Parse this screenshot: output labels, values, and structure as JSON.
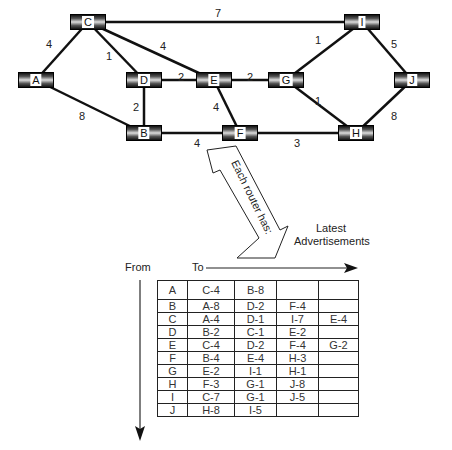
{
  "nodes": [
    {
      "id": "C",
      "x": 88,
      "y": 22
    },
    {
      "id": "I",
      "x": 362,
      "y": 22
    },
    {
      "id": "A",
      "x": 36,
      "y": 80
    },
    {
      "id": "D",
      "x": 144,
      "y": 80
    },
    {
      "id": "E",
      "x": 214,
      "y": 80
    },
    {
      "id": "G",
      "x": 286,
      "y": 80
    },
    {
      "id": "J",
      "x": 412,
      "y": 80
    },
    {
      "id": "B",
      "x": 144,
      "y": 133
    },
    {
      "id": "F",
      "x": 240,
      "y": 133
    },
    {
      "id": "H",
      "x": 356,
      "y": 133
    }
  ],
  "edges": [
    {
      "from": "C",
      "to": "I",
      "weight": "7"
    },
    {
      "from": "C",
      "to": "A",
      "weight": "4"
    },
    {
      "from": "C",
      "to": "D",
      "weight": "1"
    },
    {
      "from": "C",
      "to": "E",
      "weight": "4"
    },
    {
      "from": "A",
      "to": "B",
      "weight": "8"
    },
    {
      "from": "D",
      "to": "E",
      "weight": "2"
    },
    {
      "from": "D",
      "to": "B",
      "weight": "2"
    },
    {
      "from": "E",
      "to": "G",
      "weight": "2"
    },
    {
      "from": "E",
      "to": "F",
      "weight": "4"
    },
    {
      "from": "B",
      "to": "F",
      "weight": "4"
    },
    {
      "from": "F",
      "to": "H",
      "weight": "3"
    },
    {
      "from": "G",
      "to": "I",
      "weight": "1"
    },
    {
      "from": "G",
      "to": "H",
      "weight": "1"
    },
    {
      "from": "I",
      "to": "J",
      "weight": "5"
    },
    {
      "from": "H",
      "to": "J",
      "weight": "8"
    }
  ],
  "arrow_caption": "Each router has:",
  "latest_label_line1": "Latest",
  "latest_label_line2": "Advertisements",
  "from_label": "From",
  "to_label": "To",
  "table": {
    "rows": [
      [
        "A",
        "C-4",
        "B-8",
        "",
        ""
      ],
      [
        "B",
        "A-8",
        "D-2",
        "F-4",
        ""
      ],
      [
        "C",
        "A-4",
        "D-1",
        "I-7",
        "E-4"
      ],
      [
        "D",
        "B-2",
        "C-1",
        "E-2",
        ""
      ],
      [
        "E",
        "C-4",
        "D-2",
        "F-4",
        "G-2"
      ],
      [
        "F",
        "B-4",
        "E-4",
        "H-3",
        ""
      ],
      [
        "G",
        "E-2",
        "I-1",
        "H-1",
        ""
      ],
      [
        "H",
        "F-3",
        "G-1",
        "J-8",
        ""
      ],
      [
        "I",
        "C-7",
        "G-1",
        "J-5",
        ""
      ],
      [
        "J",
        "H-8",
        "I-5",
        "",
        ""
      ]
    ]
  }
}
